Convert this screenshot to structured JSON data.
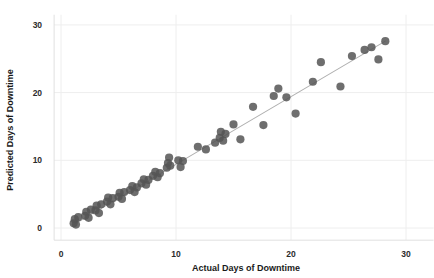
{
  "chart_data": {
    "type": "scatter",
    "title": "",
    "xlabel": "Actual Days of Downtime",
    "ylabel": "Predicted Days of Downtime",
    "xlim": [
      -0.6,
      32.4
    ],
    "ylim": [
      -1.8,
      31.5
    ],
    "xticks": [
      0,
      10,
      20,
      30
    ],
    "yticks": [
      0,
      10,
      20,
      30
    ],
    "xticklabels": [
      "0",
      "10",
      "20",
      "30"
    ],
    "yticklabels": [
      "0",
      "10",
      "20",
      "30"
    ],
    "grid": true,
    "grid_color": "#eeeeee",
    "legend": "none",
    "background": "#ffffff",
    "marker_color": "#555555",
    "marker_size": 4.1,
    "marker_opacity": 0.85,
    "line": {
      "name": "identity-fit-line",
      "color": "#b0b0b0",
      "width": 1.1,
      "x": [
        1.1,
        28.2
      ],
      "y": [
        0.5,
        27.6
      ]
    },
    "series": [
      {
        "name": "Predicted vs Actual",
        "points": [
          [
            1.1,
            0.7
          ],
          [
            1.2,
            1.3
          ],
          [
            1.3,
            0.5
          ],
          [
            1.5,
            1.6
          ],
          [
            2.1,
            1.8
          ],
          [
            2.2,
            2.4
          ],
          [
            2.4,
            1.5
          ],
          [
            2.6,
            2.7
          ],
          [
            3.0,
            2.6
          ],
          [
            3.1,
            3.3
          ],
          [
            3.3,
            2.2
          ],
          [
            3.5,
            3.5
          ],
          [
            4.0,
            3.9
          ],
          [
            4.1,
            4.5
          ],
          [
            4.3,
            3.5
          ],
          [
            4.5,
            4.4
          ],
          [
            5.0,
            4.6
          ],
          [
            5.1,
            5.2
          ],
          [
            5.3,
            4.3
          ],
          [
            5.5,
            5.3
          ],
          [
            6.0,
            5.6
          ],
          [
            6.2,
            6.2
          ],
          [
            6.4,
            5.3
          ],
          [
            6.6,
            6.0
          ],
          [
            7.0,
            6.6
          ],
          [
            7.2,
            7.2
          ],
          [
            7.4,
            6.4
          ],
          [
            7.6,
            7.1
          ],
          [
            8.0,
            7.7
          ],
          [
            8.2,
            8.3
          ],
          [
            8.4,
            7.5
          ],
          [
            8.6,
            8.1
          ],
          [
            9.2,
            8.9
          ],
          [
            9.3,
            9.6
          ],
          [
            9.4,
            10.4
          ],
          [
            9.5,
            9.2
          ],
          [
            10.2,
            10.0
          ],
          [
            10.4,
            9.0
          ],
          [
            10.6,
            9.9
          ],
          [
            11.9,
            12.0
          ],
          [
            12.6,
            11.6
          ],
          [
            13.4,
            12.6
          ],
          [
            13.8,
            13.3
          ],
          [
            13.9,
            14.2
          ],
          [
            14.1,
            12.9
          ],
          [
            14.3,
            13.9
          ],
          [
            15.0,
            15.3
          ],
          [
            15.6,
            13.1
          ],
          [
            16.7,
            17.9
          ],
          [
            17.6,
            15.2
          ],
          [
            18.5,
            19.5
          ],
          [
            18.9,
            20.6
          ],
          [
            19.6,
            19.3
          ],
          [
            20.4,
            16.9
          ],
          [
            21.9,
            21.6
          ],
          [
            22.6,
            24.5
          ],
          [
            24.3,
            20.9
          ],
          [
            25.3,
            25.4
          ],
          [
            26.4,
            26.3
          ],
          [
            27.0,
            26.7
          ],
          [
            27.6,
            24.9
          ],
          [
            28.2,
            27.6
          ]
        ]
      }
    ]
  },
  "axes": {
    "x_title": "Actual Days of Downtime",
    "y_title": "Predicted Days of Downtime"
  }
}
